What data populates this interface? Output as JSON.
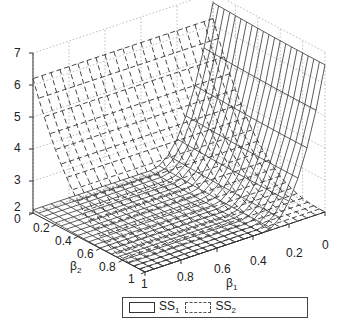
{
  "chart_data": {
    "type": "surface3d",
    "title": "",
    "xlabel": "β1",
    "ylabel": "β2",
    "zlabel": "",
    "x_ticks": [
      "0",
      "0.2",
      "0.4",
      "0.6",
      "0.8",
      "1"
    ],
    "y_ticks": [
      "0",
      "0.2",
      "0.4",
      "0.6",
      "0.8",
      "1"
    ],
    "z_ticks": [
      "2",
      "3",
      "4",
      "5",
      "6",
      "7"
    ],
    "xlim": [
      0,
      1
    ],
    "ylim": [
      0,
      1
    ],
    "zlim": [
      2,
      7
    ],
    "grid": true,
    "legend_position": "bottom",
    "series": [
      {
        "name": "SS1",
        "style": "solid mesh",
        "description": "rises steeply to ~6.6 as β1→0, ~2 minimum elsewhere",
        "approx_max": 6.6,
        "approx_min": 2.0
      },
      {
        "name": "SS2",
        "style": "dashed mesh",
        "description": "rises to ~6.2 as β2→0, ~2 minimum elsewhere",
        "approx_max": 6.2,
        "approx_min": 2.0
      }
    ]
  },
  "axes": {
    "z_ticks": [
      "7",
      "6",
      "5",
      "4",
      "3",
      "2"
    ],
    "y_ticks": [
      "0",
      "0.2",
      "0.4",
      "0.6",
      "0.8",
      "1"
    ],
    "x_ticks": [
      "1",
      "0.8",
      "0.6",
      "0.4",
      "0.2",
      "0"
    ],
    "x_label": "β",
    "x_label_sub": "1",
    "y_label": "β",
    "y_label_sub": "2"
  },
  "legend": {
    "items": [
      {
        "label": "SS",
        "sub": "1"
      },
      {
        "label": "SS",
        "sub": "2"
      }
    ]
  }
}
